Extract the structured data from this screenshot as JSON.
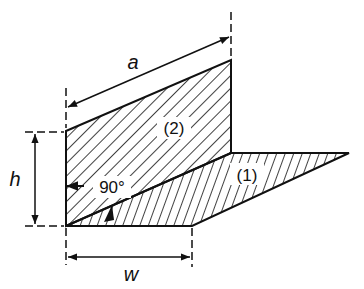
{
  "diagram": {
    "labels": {
      "a": "a",
      "h": "h",
      "w": "w",
      "angle": "90°",
      "panel1": "(1)",
      "panel2": "(2)"
    },
    "colors": {
      "stroke": "#111111",
      "background": "#ffffff"
    }
  }
}
